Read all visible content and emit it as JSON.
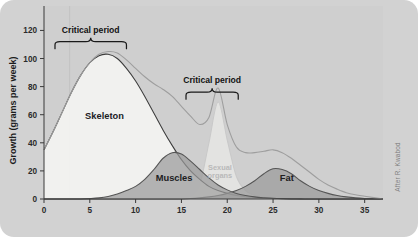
{
  "figure": {
    "background_color": "#d2d2d2",
    "plot_background_color": "#cfcfcf",
    "credit": "After R. Kwabod"
  },
  "annotations": {
    "critical_period_1": "Critical period",
    "critical_period_2": "Critical period"
  },
  "chart_data": {
    "type": "area",
    "title": "",
    "xlabel": "",
    "ylabel": "Growth (grams per week)",
    "xlim": [
      0,
      37
    ],
    "ylim": [
      0,
      126
    ],
    "xticks": [
      0,
      5,
      10,
      15,
      20,
      25,
      30,
      35
    ],
    "yticks": [
      0,
      20,
      40,
      60,
      80,
      100,
      120
    ],
    "grid": false,
    "legend_position": "inline-labels",
    "x": [
      0,
      1,
      2,
      3,
      4,
      5,
      6,
      7,
      8,
      9,
      10,
      11,
      12,
      13,
      14,
      15,
      16,
      17,
      18,
      19,
      20,
      21,
      22,
      23,
      24,
      25,
      26,
      27,
      28,
      29,
      30,
      31,
      32,
      33,
      34,
      35,
      36,
      37
    ],
    "series": [
      {
        "name": "Skeleton",
        "label": "Skeleton",
        "color": "#f2f2f0",
        "line_color": "#3c3c3c",
        "values": [
          35,
          48,
          62,
          76,
          88,
          97,
          102,
          103,
          100,
          93,
          84,
          73,
          61,
          49,
          38,
          28,
          20,
          14,
          9,
          6,
          4,
          2.5,
          1.6,
          1,
          0.6,
          0.4,
          0.2,
          0.1,
          0.1,
          0,
          0,
          0,
          0,
          0,
          0,
          0,
          0,
          0
        ]
      },
      {
        "name": "Muscles",
        "label": "Muscles",
        "color": "#9a9a9a",
        "line_color": "#555555",
        "values": [
          0,
          0,
          0,
          0,
          0,
          0.3,
          0.8,
          1.8,
          3.5,
          6,
          9,
          14,
          21,
          29,
          33,
          32,
          27,
          21,
          15,
          10,
          6.5,
          4,
          2.5,
          1.5,
          0.9,
          0.5,
          0.3,
          0.2,
          0.1,
          0,
          0,
          0,
          0,
          0,
          0,
          0,
          0,
          0
        ]
      },
      {
        "name": "Sexual organs",
        "label": "Sexual organs",
        "color": "#e4e4e2",
        "line_color": "#c9c9c9",
        "values": [
          0,
          0,
          0,
          0,
          0,
          0,
          0,
          0,
          0,
          0,
          0,
          0,
          0,
          0,
          0,
          0.5,
          2,
          10,
          40,
          69,
          42,
          16,
          6,
          2.5,
          1.2,
          0.6,
          0.3,
          0.1,
          0,
          0,
          0,
          0,
          0,
          0,
          0,
          0,
          0,
          0
        ]
      },
      {
        "name": "Fat",
        "label": "Fat",
        "color": "#9a9a9a",
        "line_color": "#555555",
        "values": [
          0,
          0,
          0,
          0,
          0,
          0,
          0,
          0,
          0,
          0,
          0,
          0,
          0,
          0,
          0,
          0,
          0.3,
          0.8,
          1.5,
          2.5,
          4,
          6,
          9,
          13,
          18,
          21.5,
          21,
          18,
          13,
          9,
          6,
          4,
          2.5,
          1.5,
          0.8,
          0.4,
          0.2,
          0
        ]
      },
      {
        "name": "Total",
        "label": "",
        "color": "none",
        "line_color": "#9e9e9e",
        "values": [
          35,
          48,
          62,
          76,
          88,
          97,
          103,
          105,
          104,
          99,
          93,
          87,
          82,
          78,
          73,
          66,
          59,
          53,
          58,
          79,
          53,
          37,
          33,
          33,
          34,
          35,
          33,
          29,
          24,
          19,
          14,
          10,
          7,
          4.5,
          3,
          2,
          1,
          0
        ]
      }
    ],
    "critical_periods": [
      {
        "label": "Critical period",
        "x_start": 1.2,
        "x_end": 9.0,
        "y": 112
      },
      {
        "label": "Critical period",
        "x_start": 15.5,
        "x_end": 21.2,
        "y": 76
      }
    ],
    "guide_line_x": 2.8
  }
}
